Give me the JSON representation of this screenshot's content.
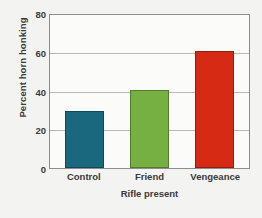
{
  "chart_data": {
    "type": "bar",
    "title": "",
    "subtitle": "",
    "xlabel": "Rifle present",
    "ylabel": "Percent horn honking",
    "categories": [
      "Control",
      "Friend",
      "Vengeance"
    ],
    "values": [
      30,
      41,
      61
    ],
    "series": [
      {
        "name": "Percent horn honking",
        "values": [
          30,
          41,
          61
        ]
      }
    ],
    "colors": [
      "#19687d",
      "#76b043",
      "#d62a15"
    ],
    "ylim": [
      0,
      80
    ],
    "yticks": [
      0,
      20,
      40,
      60,
      80
    ],
    "ytick_labels": [
      "0",
      "20",
      "40",
      "60",
      "80"
    ],
    "grid": true,
    "grid_axis": "y",
    "legend": false,
    "legend_position": "none",
    "annotations": [],
    "background_color": "#f3f3f1",
    "plot_background_color": "#fbfbfa",
    "axis_color": "#8d8d8d",
    "gridline_color": "#b9b9b9",
    "text_color": "#3a3a3a"
  }
}
